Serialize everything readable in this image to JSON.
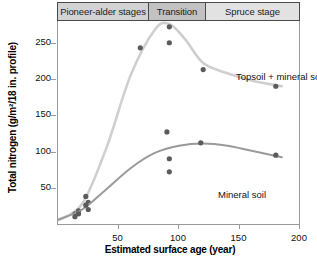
{
  "stages": {
    "items": [
      {
        "id": "pioneer",
        "label": "Pioneer-alder stages"
      },
      {
        "id": "transition",
        "label": "Transition"
      },
      {
        "id": "spruce",
        "label": "Spruce stage"
      }
    ]
  },
  "axes": {
    "x_title": "Estimated surface age (year)",
    "y_title": "Total nitrogen (g/m²/18 in. profile)",
    "x_ticks": [
      "50",
      "100",
      "150",
      "200"
    ],
    "y_ticks": [
      "50",
      "100",
      "150",
      "200",
      "250"
    ]
  },
  "labels": {
    "topsoil": "Topsoil + mineral soil",
    "mineral": "Mineral soil"
  },
  "colors": {
    "topsoil_line": "#cfcfcf",
    "mineral_line": "#9a9a9a",
    "marker": "#5b5b5b",
    "axis": "#9a9a9a",
    "header_border": "#4a4a4a"
  },
  "chart_data": {
    "type": "scatter",
    "title": "",
    "xlabel": "Estimated surface age (year)",
    "ylabel": "Total nitrogen (g/m²/18 in. profile)",
    "xlim": [
      0,
      200
    ],
    "ylim": [
      0,
      280
    ],
    "grid": false,
    "legend": "inline-annotations",
    "stage_bands": [
      {
        "label": "Pioneer-alder stages",
        "x_start": 0,
        "x_end": 75
      },
      {
        "label": "Transition",
        "x_start": 75,
        "x_end": 122
      },
      {
        "label": "Spruce stage",
        "x_start": 122,
        "x_end": 200
      }
    ],
    "series": [
      {
        "name": "Topsoil + mineral soil",
        "points": [
          {
            "x": 14,
            "y": 14
          },
          {
            "x": 17,
            "y": 18
          },
          {
            "x": 23,
            "y": 38
          },
          {
            "x": 25,
            "y": 30
          },
          {
            "x": 68,
            "y": 243
          },
          {
            "x": 90,
            "y": 285
          },
          {
            "x": 92,
            "y": 272
          },
          {
            "x": 92,
            "y": 250
          },
          {
            "x": 120,
            "y": 213
          },
          {
            "x": 180,
            "y": 190
          }
        ],
        "curve": [
          {
            "x": 0,
            "y": 5
          },
          {
            "x": 20,
            "y": 28
          },
          {
            "x": 40,
            "y": 105
          },
          {
            "x": 60,
            "y": 205
          },
          {
            "x": 80,
            "y": 268
          },
          {
            "x": 92,
            "y": 276
          },
          {
            "x": 105,
            "y": 255
          },
          {
            "x": 120,
            "y": 222
          },
          {
            "x": 140,
            "y": 208
          },
          {
            "x": 160,
            "y": 198
          },
          {
            "x": 185,
            "y": 190
          }
        ]
      },
      {
        "name": "Mineral soil",
        "points": [
          {
            "x": 14,
            "y": 10
          },
          {
            "x": 17,
            "y": 14
          },
          {
            "x": 23,
            "y": 26
          },
          {
            "x": 25,
            "y": 20
          },
          {
            "x": 90,
            "y": 127
          },
          {
            "x": 92,
            "y": 90
          },
          {
            "x": 92,
            "y": 72
          },
          {
            "x": 118,
            "y": 112
          },
          {
            "x": 180,
            "y": 95
          }
        ],
        "curve": [
          {
            "x": 0,
            "y": 6
          },
          {
            "x": 20,
            "y": 20
          },
          {
            "x": 40,
            "y": 48
          },
          {
            "x": 60,
            "y": 77
          },
          {
            "x": 80,
            "y": 98
          },
          {
            "x": 100,
            "y": 108
          },
          {
            "x": 120,
            "y": 111
          },
          {
            "x": 140,
            "y": 108
          },
          {
            "x": 160,
            "y": 101
          },
          {
            "x": 185,
            "y": 92
          }
        ]
      }
    ]
  }
}
